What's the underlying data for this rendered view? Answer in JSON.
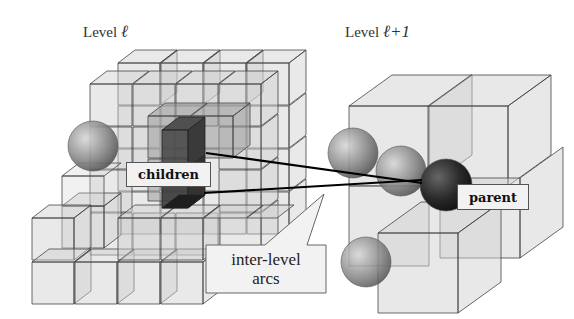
{
  "titles": {
    "left": {
      "prefix": "Level ",
      "symbol": "ℓ"
    },
    "right": {
      "prefix": "Level ",
      "symbol": "ℓ+1"
    }
  },
  "labels": {
    "children": "children",
    "parent": "parent",
    "callout_line1": "inter-level",
    "callout_line2": "arcs"
  },
  "colors": {
    "cube_fill": "#c8c8c8",
    "cube_stroke": "#444444",
    "child_fill": "#3a3a3a",
    "parent_sphere": "#1e1e1e",
    "sphere": "#8a8a8a",
    "arc": "#000000",
    "label_bg": "#f2f2f2"
  }
}
